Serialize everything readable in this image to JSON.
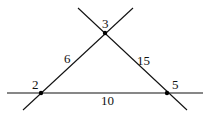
{
  "diagram": {
    "type": "graph",
    "nodes": [
      {
        "id": "3",
        "label": "3",
        "x": 105,
        "y": 33,
        "label_x": 102,
        "label_y": 28
      },
      {
        "id": "2",
        "label": "2",
        "x": 41,
        "y": 93,
        "label_x": 32,
        "label_y": 89
      },
      {
        "id": "5",
        "label": "5",
        "x": 167,
        "y": 93,
        "label_x": 172,
        "label_y": 89
      }
    ],
    "edges": [
      {
        "from": "2",
        "to": "3",
        "label": "6",
        "label_x": 64,
        "label_y": 63
      },
      {
        "from": "3",
        "to": "5",
        "label": "15",
        "label_x": 137,
        "label_y": 65
      },
      {
        "from": "2",
        "to": "5",
        "label": "10",
        "label_x": 101,
        "label_y": 105
      }
    ],
    "lines": [
      {
        "name": "line-through-2-3",
        "x1": 23,
        "y1": 110,
        "x2": 133,
        "y2": 8
      },
      {
        "name": "line-through-3-5",
        "x1": 78,
        "y1": 8,
        "x2": 187,
        "y2": 110
      },
      {
        "name": "line-through-2-5",
        "x1": 7,
        "y1": 93,
        "x2": 203,
        "y2": 93
      }
    ],
    "colors": {
      "stroke": "#111111",
      "node": "#000000",
      "background": "#ffffff"
    }
  }
}
